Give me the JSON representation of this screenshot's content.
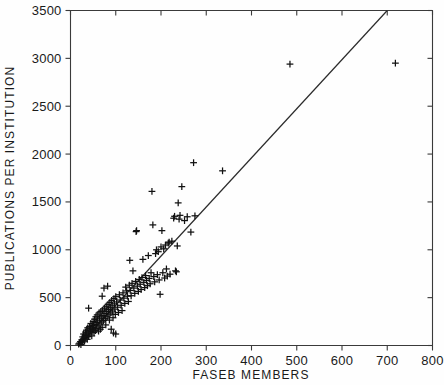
{
  "chart_data": {
    "type": "scatter",
    "title": "",
    "xlabel": "FASEB MEMBERS",
    "ylabel": "PUBLICATIONS PER INSTITUTION",
    "xlim": [
      0,
      800
    ],
    "ylim": [
      0,
      3500
    ],
    "xticks": [
      0,
      100,
      200,
      300,
      400,
      500,
      600,
      700,
      800
    ],
    "xtick_labels": [
      "0",
      "100",
      "200",
      "300",
      "400",
      "500",
      "600",
      "700",
      "800"
    ],
    "yticks": [
      0,
      500,
      1000,
      1500,
      2000,
      2500,
      3000,
      3500
    ],
    "ytick_labels": [
      "0",
      "500",
      "1000",
      "1500",
      "2000",
      "2500",
      "3000",
      "3500"
    ],
    "grid": false,
    "legend": null,
    "marker_symbol": "plus",
    "marker_color": "#111111",
    "line_color": "#2b2b2b",
    "background_color": "#fefefe",
    "frame_color": "#3a3a3a",
    "fit_line": {
      "label": "regression line",
      "x_start": 18,
      "y_start": 0,
      "x_end": 700,
      "y_end": 3500,
      "slope": 5.13,
      "intercept": -92
    },
    "points": [
      [
        18,
        15
      ],
      [
        20,
        25
      ],
      [
        22,
        40
      ],
      [
        23,
        10
      ],
      [
        25,
        60
      ],
      [
        26,
        35
      ],
      [
        27,
        90
      ],
      [
        28,
        55
      ],
      [
        29,
        120
      ],
      [
        30,
        75
      ],
      [
        31,
        45
      ],
      [
        32,
        105
      ],
      [
        33,
        140
      ],
      [
        34,
        85
      ],
      [
        35,
        160
      ],
      [
        36,
        110
      ],
      [
        37,
        65
      ],
      [
        38,
        185
      ],
      [
        39,
        130
      ],
      [
        40,
        95
      ],
      [
        40,
        390
      ],
      [
        41,
        150
      ],
      [
        42,
        200
      ],
      [
        43,
        120
      ],
      [
        44,
        175
      ],
      [
        45,
        230
      ],
      [
        46,
        145
      ],
      [
        47,
        100
      ],
      [
        48,
        210
      ],
      [
        49,
        165
      ],
      [
        50,
        250
      ],
      [
        51,
        190
      ],
      [
        52,
        135
      ],
      [
        53,
        275
      ],
      [
        54,
        220
      ],
      [
        55,
        155
      ],
      [
        56,
        300
      ],
      [
        57,
        240
      ],
      [
        58,
        180
      ],
      [
        59,
        320
      ],
      [
        60,
        265
      ],
      [
        61,
        205
      ],
      [
        62,
        150
      ],
      [
        63,
        340
      ],
      [
        64,
        285
      ],
      [
        65,
        225
      ],
      [
        66,
        170
      ],
      [
        67,
        355
      ],
      [
        68,
        300
      ],
      [
        69,
        245
      ],
      [
        70,
        515
      ],
      [
        70,
        190
      ],
      [
        71,
        370
      ],
      [
        72,
        315
      ],
      [
        73,
        260
      ],
      [
        74,
        600
      ],
      [
        75,
        390
      ],
      [
        76,
        335
      ],
      [
        77,
        280
      ],
      [
        78,
        215
      ],
      [
        79,
        410
      ],
      [
        80,
        355
      ],
      [
        81,
        300
      ],
      [
        82,
        620
      ],
      [
        83,
        430
      ],
      [
        84,
        375
      ],
      [
        85,
        320
      ],
      [
        86,
        265
      ],
      [
        87,
        450
      ],
      [
        88,
        395
      ],
      [
        89,
        340
      ],
      [
        90,
        170
      ],
      [
        91,
        470
      ],
      [
        92,
        415
      ],
      [
        93,
        360
      ],
      [
        94,
        290
      ],
      [
        95,
        130
      ],
      [
        96,
        490
      ],
      [
        97,
        435
      ],
      [
        98,
        380
      ],
      [
        99,
        325
      ],
      [
        100,
        120
      ],
      [
        100,
        510
      ],
      [
        102,
        455
      ],
      [
        104,
        400
      ],
      [
        106,
        345
      ],
      [
        108,
        530
      ],
      [
        110,
        475
      ],
      [
        112,
        420
      ],
      [
        114,
        365
      ],
      [
        116,
        550
      ],
      [
        118,
        495
      ],
      [
        120,
        440
      ],
      [
        122,
        610
      ],
      [
        124,
        570
      ],
      [
        126,
        515
      ],
      [
        128,
        460
      ],
      [
        130,
        630
      ],
      [
        131,
        890
      ],
      [
        132,
        575
      ],
      [
        134,
        520
      ],
      [
        136,
        650
      ],
      [
        138,
        780
      ],
      [
        140,
        600
      ],
      [
        142,
        545
      ],
      [
        144,
        670
      ],
      [
        145,
        1190
      ],
      [
        146,
        1200
      ],
      [
        148,
        620
      ],
      [
        150,
        565
      ],
      [
        152,
        690
      ],
      [
        154,
        640
      ],
      [
        156,
        585
      ],
      [
        158,
        710
      ],
      [
        160,
        900
      ],
      [
        162,
        660
      ],
      [
        164,
        605
      ],
      [
        166,
        730
      ],
      [
        168,
        680
      ],
      [
        170,
        625
      ],
      [
        172,
        940
      ],
      [
        174,
        700
      ],
      [
        176,
        645
      ],
      [
        178,
        760
      ],
      [
        180,
        1610
      ],
      [
        182,
        1260
      ],
      [
        184,
        720
      ],
      [
        186,
        665
      ],
      [
        188,
        960
      ],
      [
        190,
        1000
      ],
      [
        192,
        740
      ],
      [
        194,
        980
      ],
      [
        196,
        685
      ],
      [
        198,
        535
      ],
      [
        200,
        1030
      ],
      [
        202,
        1200
      ],
      [
        204,
        760
      ],
      [
        206,
        1010
      ],
      [
        208,
        705
      ],
      [
        210,
        1050
      ],
      [
        212,
        800
      ],
      [
        214,
        725
      ],
      [
        216,
        1070
      ],
      [
        218,
        1080
      ],
      [
        220,
        745
      ],
      [
        224,
        1090
      ],
      [
        228,
        1330
      ],
      [
        230,
        1350
      ],
      [
        232,
        780
      ],
      [
        234,
        770
      ],
      [
        236,
        1040
      ],
      [
        238,
        1490
      ],
      [
        240,
        1320
      ],
      [
        242,
        1360
      ],
      [
        246,
        1660
      ],
      [
        252,
        1305
      ],
      [
        258,
        1345
      ],
      [
        266,
        1185
      ],
      [
        272,
        1910
      ],
      [
        275,
        1355
      ],
      [
        336,
        1825
      ],
      [
        485,
        2940
      ],
      [
        718,
        2950
      ]
    ]
  },
  "accessibility": {
    "description": "Scatter plot of publications per institution versus FASEB members with a fitted straight line"
  }
}
